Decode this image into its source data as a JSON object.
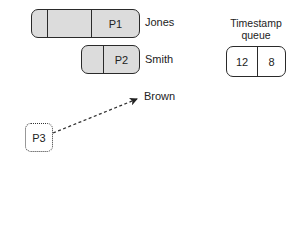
{
  "diagram": {
    "processes": [
      {
        "id": "P1",
        "label": "P1",
        "owner": "Jones",
        "segments": 3
      },
      {
        "id": "P2",
        "label": "P2",
        "owner": "Smith",
        "segments": 2
      }
    ],
    "pending": {
      "id": "P3",
      "label": "P3",
      "target": "Brown"
    },
    "queue": {
      "title_line1": "Timestamp",
      "title_line2": "queue",
      "values": [
        "12",
        "8"
      ]
    },
    "colors": {
      "process_fill": "#dcdcdc",
      "stroke": "#2a2a2a"
    }
  }
}
